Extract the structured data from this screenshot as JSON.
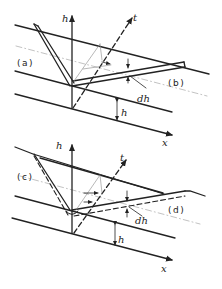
{
  "figure": {
    "panels": [
      {
        "id": "top",
        "axes": {
          "vertical": "h",
          "oblique": "t",
          "horizontal": "x"
        },
        "regions": {
          "left": "(a)",
          "right": "(b)"
        },
        "annotations": {
          "increment": "dh",
          "height": "h"
        }
      },
      {
        "id": "bottom",
        "axes": {
          "vertical": "h",
          "oblique": "t",
          "horizontal": "x"
        },
        "regions": {
          "left": "(c)",
          "right": "(d)"
        },
        "annotations": {
          "increment": "dh",
          "height": "h"
        }
      }
    ],
    "colors": {
      "ink": "#222222",
      "light_ink": "#888888",
      "background": "#ffffff"
    }
  }
}
